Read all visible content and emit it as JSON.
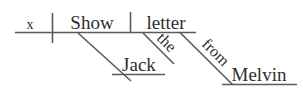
{
  "diagram": {
    "type": "reed-kellogg-sentence-diagram",
    "sentence": "Show Jack the letter from Melvin",
    "stroke_color": "#5a5a5a",
    "text_color": "#2e2e2e",
    "background_color": "#ffffff",
    "words": {
      "subject": "x",
      "verb": "Show",
      "indirect_object": "Jack",
      "direct_object": "letter",
      "article": "the",
      "preposition": "from",
      "object_of_preposition": "Melvin"
    },
    "labels": [
      {
        "id": "subject",
        "text": "x",
        "role": "subject-implied-you"
      },
      {
        "id": "verb",
        "text": "Show",
        "role": "predicate-verb"
      },
      {
        "id": "direct-object",
        "text": "letter",
        "role": "direct-object"
      },
      {
        "id": "indirect-object",
        "text": "Jack",
        "role": "indirect-object"
      },
      {
        "id": "article",
        "text": "the",
        "role": "article-modifier"
      },
      {
        "id": "preposition",
        "text": "from",
        "role": "preposition"
      },
      {
        "id": "prep-object",
        "text": "Melvin",
        "role": "object-of-preposition"
      }
    ]
  }
}
